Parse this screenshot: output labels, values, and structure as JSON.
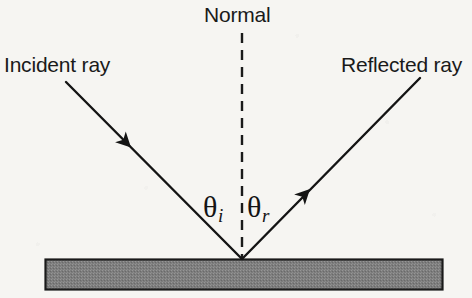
{
  "diagram": {
    "background_color": "#f6f5f2",
    "ink_color": "#141414",
    "surface_color": "#808080",
    "labels": {
      "normal": "Normal",
      "incident_ray": "Incident ray",
      "reflected_ray": "Reflected ray",
      "angle_incidence_symbol": "θ",
      "angle_incidence_subscript": "i",
      "angle_reflection_symbol": "θ",
      "angle_reflection_subscript": "r"
    },
    "geometry": {
      "vertex": {
        "x": 242,
        "y": 259
      },
      "incident_ray": {
        "x1": 66,
        "y1": 82,
        "x2": 242,
        "y2": 259
      },
      "reflected_ray": {
        "x1": 242,
        "y1": 259,
        "x2": 420,
        "y2": 78
      },
      "normal_line": {
        "x": 242,
        "y1": 33,
        "y2": 259,
        "dash": "10 7"
      },
      "incident_arrow": {
        "x": 131,
        "y": 148
      },
      "reflected_arrow": {
        "x": 310,
        "y": 189
      },
      "mirror_bar": {
        "x": 45,
        "y": 259,
        "width": 398,
        "height": 31
      }
    },
    "icons": {
      "incident_arrowhead": "arrowhead-down-right-icon",
      "reflected_arrowhead": "arrowhead-up-right-icon"
    }
  }
}
